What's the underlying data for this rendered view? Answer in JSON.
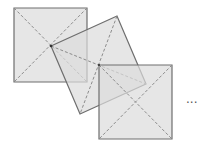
{
  "diagram": {
    "colors": {
      "fill": "#dcdcdc",
      "fill_opacity": 0.7,
      "border": "#6e6e6e",
      "diagonal": "#8c8c8c",
      "center_point": "#333333"
    },
    "squares": [
      {
        "id": "square-1",
        "corners": [
          [
            14,
            8
          ],
          [
            87,
            8
          ],
          [
            87,
            82
          ],
          [
            14,
            82
          ]
        ],
        "diagonals": [
          [
            [
              14,
              8
            ],
            [
              87,
              82
            ]
          ],
          [
            [
              87,
              8
            ],
            [
              14,
              82
            ]
          ]
        ]
      },
      {
        "id": "square-2-rotated",
        "corners": [
          [
            51,
            46
          ],
          [
            117,
            16
          ],
          [
            146,
            84
          ],
          [
            80,
            114
          ]
        ],
        "diagonals": [
          [
            [
              51,
              46
            ],
            [
              146,
              84
            ]
          ],
          [
            [
              117,
              16
            ],
            [
              80,
              114
            ]
          ]
        ]
      },
      {
        "id": "square-3",
        "corners": [
          [
            99,
            65
          ],
          [
            172,
            65
          ],
          [
            172,
            139
          ],
          [
            99,
            139
          ]
        ],
        "diagonals": [
          [
            [
              99,
              65
            ],
            [
              172,
              139
            ]
          ],
          [
            [
              172,
              65
            ],
            [
              99,
              139
            ]
          ]
        ]
      }
    ],
    "continuation": "···"
  }
}
